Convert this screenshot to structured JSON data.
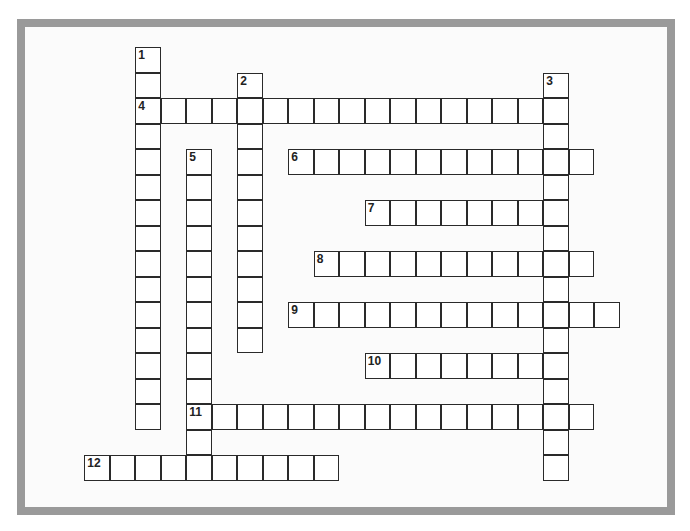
{
  "puzzle": {
    "type": "crossword",
    "entries": [
      {
        "number": "1",
        "direction": "down",
        "row": 0,
        "col": 0,
        "length": 15
      },
      {
        "number": "2",
        "direction": "down",
        "row": 1,
        "col": 4,
        "length": 11
      },
      {
        "number": "3",
        "direction": "down",
        "row": 1,
        "col": 16,
        "length": 16
      },
      {
        "number": "4",
        "direction": "across",
        "row": 2,
        "col": 0,
        "length": 17
      },
      {
        "number": "5",
        "direction": "down",
        "row": 4,
        "col": 2,
        "length": 13
      },
      {
        "number": "6",
        "direction": "across",
        "row": 4,
        "col": 6,
        "length": 12
      },
      {
        "number": "7",
        "direction": "across",
        "row": 6,
        "col": 9,
        "length": 8
      },
      {
        "number": "8",
        "direction": "across",
        "row": 8,
        "col": 7,
        "length": 11
      },
      {
        "number": "9",
        "direction": "across",
        "row": 10,
        "col": 6,
        "length": 13
      },
      {
        "number": "10",
        "direction": "across",
        "row": 12,
        "col": 9,
        "length": 8
      },
      {
        "number": "11",
        "direction": "across",
        "row": 14,
        "col": 2,
        "length": 16
      },
      {
        "number": "12",
        "direction": "across",
        "row": 16,
        "col": -2,
        "length": 10
      }
    ]
  }
}
